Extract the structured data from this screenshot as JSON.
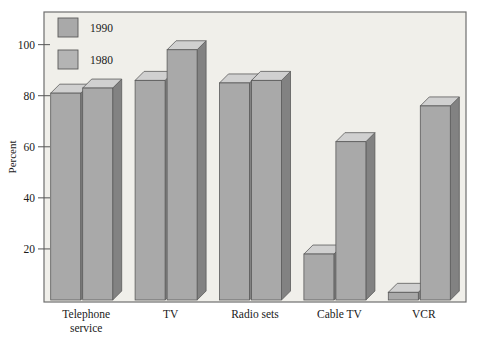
{
  "chart_data": {
    "type": "bar",
    "title": "",
    "subtitle": "",
    "xlabel": "",
    "ylabel": "Percent",
    "categories": [
      "Telephone service",
      "TV",
      "Radio sets",
      "Cable TV",
      "VCR"
    ],
    "series": [
      {
        "name": "1980",
        "values": [
          81,
          86,
          85,
          18,
          3
        ],
        "color": "#b0b0b0"
      },
      {
        "name": "1990",
        "values": [
          83,
          98,
          86,
          62,
          76
        ],
        "color": "#a0a0a0"
      }
    ],
    "ylim": [
      0,
      112
    ],
    "yticks": [
      20,
      40,
      60,
      80,
      100
    ],
    "ytick_labels": [
      "20",
      "40",
      "60",
      "80",
      "100"
    ],
    "grid": false,
    "legend_position": "top-left",
    "style": "3d-bars",
    "bar_face_color": "#a9a9a9",
    "bar_side_color": "#828282",
    "bar_top_color": "#d0d0d0",
    "bar_edge_color": "#5a5a5a",
    "plot_background": "#f0efea",
    "frame_color": "#6e6e6e",
    "page_background": "#ffffff",
    "text_color": "#1a1a1a"
  },
  "legend": {
    "entries": [
      {
        "label": "1990"
      },
      {
        "label": "1980"
      }
    ]
  },
  "axes": {
    "y_axis_title": "Percent",
    "y_tick_labels": [
      "100",
      "80",
      "60",
      "40",
      "20"
    ],
    "x_tick_labels": [
      {
        "line1": "Telephone",
        "line2": "service"
      },
      {
        "line1": "TV",
        "line2": ""
      },
      {
        "line1": "Radio sets",
        "line2": ""
      },
      {
        "line1": "Cable TV",
        "line2": ""
      },
      {
        "line1": "VCR",
        "line2": ""
      }
    ]
  }
}
